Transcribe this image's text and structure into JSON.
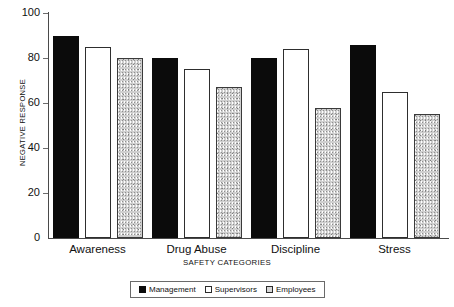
{
  "chart_data": {
    "type": "bar",
    "title": "",
    "xlabel": "SAFETY CATEGORIES",
    "ylabel": "NEGATIVE RESPONSE",
    "categories": [
      "Awareness",
      "Drug Abuse",
      "Discipline",
      "Stress"
    ],
    "series": [
      {
        "name": "Management",
        "values": [
          90,
          80,
          80,
          86
        ],
        "color": "#0b0b0b",
        "fill": "solid-black"
      },
      {
        "name": "Supervisors",
        "values": [
          85,
          75,
          84,
          65
        ],
        "color": "#ffffff",
        "fill": "white-outline"
      },
      {
        "name": "Employees",
        "values": [
          80,
          67,
          58,
          55
        ],
        "color": "#cfcfcf",
        "fill": "gray-stipple"
      }
    ],
    "ylim": [
      0,
      100
    ],
    "yticks": [
      "0",
      "20",
      "40",
      "60",
      "80",
      "100"
    ],
    "ytick_values": [
      0,
      20,
      40,
      60,
      80,
      100
    ],
    "grid": false,
    "legend_position": "bottom"
  },
  "legend": {
    "entries": [
      {
        "label": "Management",
        "swatch": "solid-black-swatch"
      },
      {
        "label": "Supervisors",
        "swatch": "white-outline-swatch"
      },
      {
        "label": "Employees",
        "swatch": "gray-stipple-swatch"
      }
    ]
  }
}
